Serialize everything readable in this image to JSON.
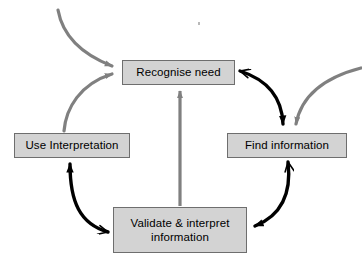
{
  "diagram": {
    "type": "cycle-flow-diagram",
    "colors": {
      "box_fill": "#d3d3d3",
      "box_border": "#6e6e6e",
      "internal_arrow": "#000000",
      "external_arrow": "#808080",
      "background": "#ffffff",
      "text": "#000000"
    },
    "nodes": [
      {
        "id": "recognise-need",
        "label": "Recognise need",
        "position": "top-center"
      },
      {
        "id": "use-interpretation",
        "label": "Use Interpretation",
        "position": "middle-left"
      },
      {
        "id": "find-information",
        "label": "Find information",
        "position": "middle-right"
      },
      {
        "id": "validate-interpret",
        "label": "Validate & interpret\ninformation",
        "position": "bottom-center"
      }
    ],
    "edges": [
      {
        "id": "recognise-to-find",
        "from": "recognise-need",
        "to": "find-information",
        "style": "black-curve",
        "note": "clockwise, double-headed: arrowhead also points back into Recognise need"
      },
      {
        "id": "find-to-validate",
        "from": "find-information",
        "to": "validate-interpret",
        "style": "black-curve",
        "note": "clockwise, double-headed: arrowhead also points back into Find information"
      },
      {
        "id": "validate-to-use",
        "from": "validate-interpret",
        "to": "use-interpretation",
        "style": "black-curve",
        "note": "counter-clockwise up the left side"
      },
      {
        "id": "use-to-recognise",
        "from": "use-interpretation",
        "to": "recognise-need",
        "style": "gray-curve"
      },
      {
        "id": "validate-to-recognise",
        "from": "validate-interpret",
        "to": "recognise-need",
        "style": "gray-straight-vertical"
      },
      {
        "id": "external-to-recognise",
        "from": "external-top-left",
        "to": "recognise-need",
        "style": "gray-curve"
      },
      {
        "id": "external-to-find",
        "from": "external-right",
        "to": "find-information",
        "style": "gray-curve"
      }
    ]
  }
}
